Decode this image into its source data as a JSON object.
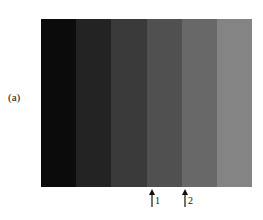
{
  "figure": {
    "panel_label": "(a)",
    "bands": [
      {
        "index": 1,
        "color": "#0b0b0b"
      },
      {
        "index": 2,
        "color": "#232323"
      },
      {
        "index": 3,
        "color": "#3a3a3a"
      },
      {
        "index": 4,
        "color": "#505050"
      },
      {
        "index": 5,
        "color": "#686868"
      },
      {
        "index": 6,
        "color": "#848484"
      }
    ],
    "markers": [
      {
        "label": "1",
        "x": 148
      },
      {
        "label": "2",
        "x": 181
      }
    ]
  }
}
